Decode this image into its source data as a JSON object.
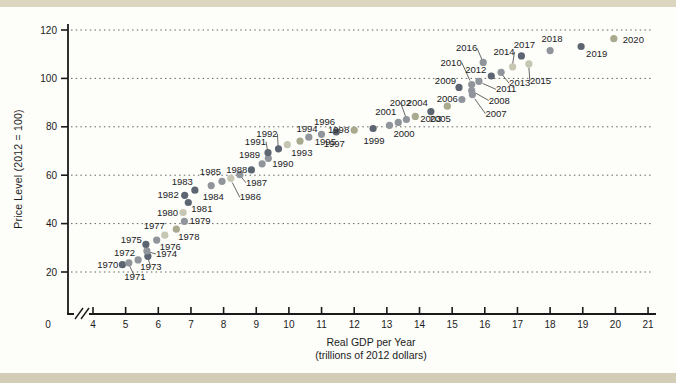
{
  "chart_data": {
    "type": "scatter",
    "title": "",
    "ylabel": "Price Level (2012 = 100)",
    "xlabel_line1": "Real GDP per Year",
    "xlabel_line2": "(trillions of 2012 dollars)",
    "x_origin_label": "0",
    "x_ticks": [
      4,
      5,
      6,
      7,
      8,
      9,
      10,
      11,
      12,
      13,
      14,
      15,
      16,
      17,
      18,
      19,
      20,
      21
    ],
    "y_ticks": [
      20,
      40,
      60,
      80,
      100,
      120
    ],
    "xlim": [
      4,
      21
    ],
    "ylim": [
      20,
      120
    ],
    "grid": "horizontal-dotted",
    "axis_break_x": true,
    "legend": "none",
    "palette": {
      "dark": "#5c6571",
      "gray": "#8f959b",
      "olive": "#a9aa8d",
      "light": "#c6c6b2"
    },
    "axis_color": "#1a1a1a",
    "leader_color": "#555555",
    "points": [
      {
        "year": "1970",
        "gdp": 4.9,
        "price": 23.0,
        "color": "dark",
        "anchor": "end",
        "dx": -4,
        "dy": 3,
        "leader": null
      },
      {
        "year": "1971",
        "gdp": 5.1,
        "price": 23.8,
        "color": "gray",
        "anchor": "middle",
        "dx": 6,
        "dy": 17,
        "leader": {
          "lx": 2,
          "ly": 10
        }
      },
      {
        "year": "1972",
        "gdp": 5.38,
        "price": 25.0,
        "color": "gray",
        "anchor": "end",
        "dx": -3,
        "dy": -4,
        "leader": null
      },
      {
        "year": "1973",
        "gdp": 5.68,
        "price": 26.5,
        "color": "dark",
        "anchor": "middle",
        "dx": 3,
        "dy": 14,
        "leader": {
          "lx": 1,
          "ly": 8
        }
      },
      {
        "year": "1974",
        "gdp": 5.65,
        "price": 28.7,
        "color": "gray",
        "anchor": "start",
        "dx": 9,
        "dy": 6,
        "leader": {
          "lx": 5,
          "ly": 3
        }
      },
      {
        "year": "1975",
        "gdp": 5.62,
        "price": 31.4,
        "color": "dark",
        "anchor": "end",
        "dx": -4,
        "dy": -1,
        "leader": null
      },
      {
        "year": "1976",
        "gdp": 5.95,
        "price": 33.2,
        "color": "gray",
        "anchor": "start",
        "dx": 3,
        "dy": 10,
        "leader": null
      },
      {
        "year": "1977",
        "gdp": 6.2,
        "price": 35.2,
        "color": "light",
        "anchor": "end",
        "dx": 0,
        "dy": -6,
        "leader": null
      },
      {
        "year": "1978",
        "gdp": 6.55,
        "price": 37.7,
        "color": "olive",
        "anchor": "start",
        "dx": 2,
        "dy": 11,
        "leader": null
      },
      {
        "year": "1979",
        "gdp": 6.8,
        "price": 40.9,
        "color": "gray",
        "anchor": "start",
        "dx": 5,
        "dy": 3,
        "leader": null
      },
      {
        "year": "1980",
        "gdp": 6.76,
        "price": 44.6,
        "color": "light",
        "anchor": "end",
        "dx": -5,
        "dy": 3,
        "leader": null
      },
      {
        "year": "1981",
        "gdp": 6.92,
        "price": 48.7,
        "color": "dark",
        "anchor": "start",
        "dx": 3,
        "dy": 9,
        "leader": null
      },
      {
        "year": "1982",
        "gdp": 6.81,
        "price": 51.7,
        "color": "dark",
        "anchor": "end",
        "dx": -6,
        "dy": 3,
        "leader": null
      },
      {
        "year": "1983",
        "gdp": 7.12,
        "price": 53.8,
        "color": "dark",
        "anchor": "end",
        "dx": -2,
        "dy": -5,
        "leader": null
      },
      {
        "year": "1984",
        "gdp": 7.62,
        "price": 55.7,
        "color": "gray",
        "anchor": "middle",
        "dx": 2,
        "dy": 14,
        "leader": null
      },
      {
        "year": "1985",
        "gdp": 7.95,
        "price": 57.5,
        "color": "gray",
        "anchor": "end",
        "dx": -1,
        "dy": -6,
        "leader": null
      },
      {
        "year": "1986",
        "gdp": 8.22,
        "price": 58.7,
        "color": "light",
        "anchor": "start",
        "dx": 9,
        "dy": 22,
        "leader": {
          "lx": 5,
          "ly": 14
        }
      },
      {
        "year": "1987",
        "gdp": 8.5,
        "price": 60.2,
        "color": "gray",
        "anchor": "start",
        "dx": 6,
        "dy": 11,
        "leader": {
          "lx": 3,
          "ly": 6
        }
      },
      {
        "year": "1988",
        "gdp": 8.85,
        "price": 62.2,
        "color": "dark",
        "anchor": "end",
        "dx": -4,
        "dy": 3,
        "leader": null
      },
      {
        "year": "1989",
        "gdp": 9.18,
        "price": 64.7,
        "color": "gray",
        "anchor": "end",
        "dx": -2,
        "dy": -6,
        "leader": null
      },
      {
        "year": "1990",
        "gdp": 9.37,
        "price": 67.0,
        "color": "gray",
        "anchor": "start",
        "dx": 4,
        "dy": 9,
        "leader": null
      },
      {
        "year": "1991",
        "gdp": 9.36,
        "price": 69.3,
        "color": "dark",
        "anchor": "end",
        "dx": -2,
        "dy": -8,
        "leader": {
          "lx": -1,
          "ly": -5
        }
      },
      {
        "year": "1992",
        "gdp": 9.68,
        "price": 70.9,
        "color": "dark",
        "anchor": "end",
        "dx": -1,
        "dy": -12,
        "leader": {
          "lx": -1,
          "ly": -7
        }
      },
      {
        "year": "1993",
        "gdp": 9.95,
        "price": 72.6,
        "color": "light",
        "anchor": "start",
        "dx": 4,
        "dy": 11,
        "leader": null
      },
      {
        "year": "1994",
        "gdp": 10.34,
        "price": 74.1,
        "color": "olive",
        "anchor": "middle",
        "dx": 7,
        "dy": -9,
        "leader": null
      },
      {
        "year": "1995",
        "gdp": 10.61,
        "price": 75.7,
        "color": "gray",
        "anchor": "start",
        "dx": 6,
        "dy": 8,
        "leader": null
      },
      {
        "year": "1996",
        "gdp": 11.0,
        "price": 76.9,
        "color": "gray",
        "anchor": "middle",
        "dx": 3,
        "dy": -9,
        "leader": null
      },
      {
        "year": "1997",
        "gdp": 11.45,
        "price": 77.9,
        "color": "dark",
        "anchor": "middle",
        "dx": -2,
        "dy": 15,
        "leader": null
      },
      {
        "year": "1998",
        "gdp": 12.0,
        "price": 78.6,
        "color": "olive",
        "anchor": "end",
        "dx": -5,
        "dy": 3,
        "leader": null
      },
      {
        "year": "1999",
        "gdp": 12.58,
        "price": 79.3,
        "color": "dark",
        "anchor": "middle",
        "dx": 1,
        "dy": 15,
        "leader": null
      },
      {
        "year": "2000",
        "gdp": 13.08,
        "price": 80.6,
        "color": "gray",
        "anchor": "start",
        "dx": 4,
        "dy": 12,
        "leader": null
      },
      {
        "year": "2001",
        "gdp": 13.35,
        "price": 81.8,
        "color": "gray",
        "anchor": "end",
        "dx": -2,
        "dy": -7,
        "leader": null
      },
      {
        "year": "2002",
        "gdp": 13.6,
        "price": 83.0,
        "color": "gray",
        "anchor": "middle",
        "dx": -6,
        "dy": -14,
        "leader": {
          "lx": -2,
          "ly": -8
        }
      },
      {
        "year": "2003",
        "gdp": 13.87,
        "price": 84.3,
        "color": "olive",
        "anchor": "start",
        "dx": 5,
        "dy": 6,
        "leader": null
      },
      {
        "year": "2004",
        "gdp": 14.35,
        "price": 86.3,
        "color": "dark",
        "anchor": "end",
        "dx": -3,
        "dy": -6,
        "leader": null
      },
      {
        "year": "2005",
        "gdp": 14.85,
        "price": 88.5,
        "color": "olive",
        "anchor": "middle",
        "dx": -7,
        "dy": 16,
        "leader": null
      },
      {
        "year": "2006",
        "gdp": 15.3,
        "price": 91.3,
        "color": "gray",
        "anchor": "end",
        "dx": -4,
        "dy": 2,
        "leader": null
      },
      {
        "year": "2007",
        "gdp": 15.62,
        "price": 93.3,
        "color": "gray",
        "anchor": "start",
        "dx": 13,
        "dy": 22,
        "leader": {
          "lx": 8,
          "ly": 14
        }
      },
      {
        "year": "2008",
        "gdp": 15.6,
        "price": 95.0,
        "color": "gray",
        "anchor": "start",
        "dx": 17,
        "dy": 13,
        "leader": {
          "lx": 12,
          "ly": 8
        }
      },
      {
        "year": "2009",
        "gdp": 15.21,
        "price": 96.3,
        "color": "dark",
        "anchor": "end",
        "dx": -3,
        "dy": -3,
        "leader": null
      },
      {
        "year": "2010",
        "gdp": 15.6,
        "price": 97.5,
        "color": "gray",
        "anchor": "end",
        "dx": -10,
        "dy": -19,
        "leader": {
          "lx": -6,
          "ly": -13
        }
      },
      {
        "year": "2011",
        "gdp": 15.82,
        "price": 98.8,
        "color": "gray",
        "anchor": "start",
        "dx": 17,
        "dy": 11,
        "leader": {
          "lx": 12,
          "ly": 7
        }
      },
      {
        "year": "2012",
        "gdp": 16.2,
        "price": 101.0,
        "color": "dark",
        "anchor": "end",
        "dx": -5,
        "dy": -3,
        "leader": null
      },
      {
        "year": "2013",
        "gdp": 16.5,
        "price": 102.5,
        "color": "gray",
        "anchor": "start",
        "dx": 8,
        "dy": 14,
        "leader": {
          "lx": 4,
          "ly": 8
        }
      },
      {
        "year": "2014",
        "gdp": 16.85,
        "price": 104.8,
        "color": "light",
        "anchor": "end",
        "dx": 2,
        "dy": -12,
        "leader": {
          "lx": 0,
          "ly": -7
        }
      },
      {
        "year": "2015",
        "gdp": 17.35,
        "price": 106.0,
        "color": "light",
        "anchor": "start",
        "dx": 1,
        "dy": 20,
        "leader": {
          "lx": 0,
          "ly": 12
        }
      },
      {
        "year": "2016",
        "gdp": 15.95,
        "price": 106.6,
        "color": "gray",
        "anchor": "end",
        "dx": -6,
        "dy": -11,
        "leader": {
          "lx": -3,
          "ly": -7
        }
      },
      {
        "year": "2017",
        "gdp": 17.12,
        "price": 109.3,
        "color": "dark",
        "anchor": "middle",
        "dx": 3,
        "dy": -8,
        "leader": null
      },
      {
        "year": "2018",
        "gdp": 18.0,
        "price": 111.5,
        "color": "gray",
        "anchor": "middle",
        "dx": 2,
        "dy": -9,
        "leader": null
      },
      {
        "year": "2019",
        "gdp": 18.95,
        "price": 113.2,
        "color": "dark",
        "anchor": "start",
        "dx": 5,
        "dy": 10,
        "leader": null
      },
      {
        "year": "2020",
        "gdp": 19.95,
        "price": 116.4,
        "color": "olive",
        "anchor": "start",
        "dx": 9,
        "dy": 4,
        "leader": null
      }
    ]
  }
}
